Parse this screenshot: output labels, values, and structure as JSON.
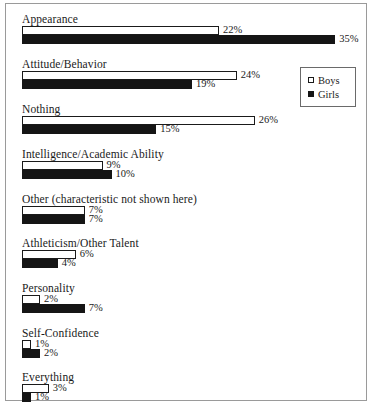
{
  "chart_data": {
    "type": "bar",
    "orientation": "horizontal",
    "title": "",
    "subtitle": "",
    "xlabel": "",
    "ylabel": "",
    "grid": false,
    "xlim": [
      0,
      38
    ],
    "value_suffix": "%",
    "legend_position": "top-right",
    "categories": [
      "Appearance",
      "Attitude/Behavior",
      "Nothing",
      "Intelligence/Academic Ability",
      "Other (characteristic not shown here)",
      "Athleticism/Other Talent",
      "Personality",
      "Self-Confidence",
      "Everything"
    ],
    "series": [
      {
        "name": "Boys",
        "color": "#ffffff",
        "values": [
          22,
          24,
          26,
          9,
          7,
          6,
          2,
          1,
          3
        ],
        "labels": [
          "22%",
          "24%",
          "26%",
          "9%",
          "7%",
          "6%",
          "2%",
          "1%",
          "3%"
        ]
      },
      {
        "name": "Girls",
        "color": "#151515",
        "values": [
          35,
          19,
          15,
          10,
          7,
          4,
          7,
          2,
          1
        ],
        "labels": [
          "35%",
          "19%",
          "15%",
          "10%",
          "7%",
          "4%",
          "7%",
          "2%",
          "1%"
        ]
      }
    ]
  },
  "legend": {
    "entries": [
      {
        "label": "Boys",
        "swatch": "open-square"
      },
      {
        "label": "Girls",
        "swatch": "filled-square"
      }
    ]
  }
}
